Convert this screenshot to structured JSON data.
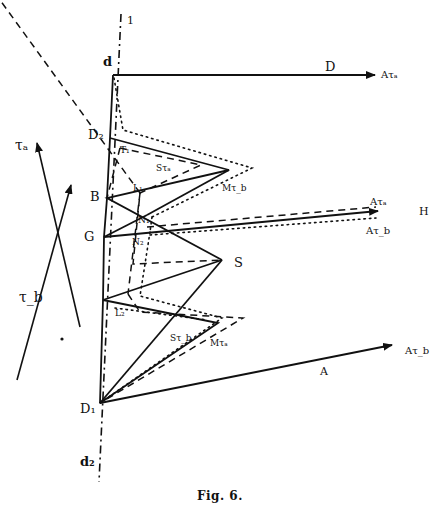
{
  "figure": {
    "caption": "Fig. 6.",
    "colors": {
      "ink": "#111111",
      "background": "#ffffff"
    }
  },
  "labels": {
    "axis_top": "1",
    "d": "d",
    "d2": "d₂",
    "D": "D",
    "A_tau_a_top": "Aτₐ",
    "D2": "D₂",
    "T1": "T₁",
    "S_tau_a": "Sτₐ",
    "M_tau_b": "Mτ_b",
    "B": "B",
    "L1": "L₁",
    "N1": "N₁",
    "N2": "N₂",
    "G": "G",
    "S": "S",
    "A_tau_a_mid": "Aτₐ",
    "H": "H",
    "A_tau_b_mid": "Aτ_b",
    "L2": "L₂",
    "S_tau_b": "Sτ_b",
    "M_tau_a": "Mτₐ",
    "A": "A",
    "A_tau_b_bottom": "Aτ_b",
    "D1": "D₁",
    "tau_a": "τₐ",
    "tau_b": "τ_b"
  }
}
